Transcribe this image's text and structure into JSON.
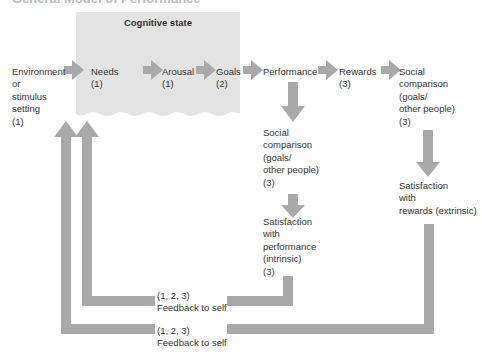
{
  "title": "General Model of Performance",
  "cognitive_state": {
    "label": "Cognitive state"
  },
  "nodes": {
    "environment": {
      "lines": [
        "Environment",
        "or",
        "stimulus",
        "setting",
        "(1)"
      ]
    },
    "needs": {
      "lines": [
        "Needs",
        "(1)"
      ]
    },
    "arousal": {
      "lines": [
        "Arousal",
        "(1)"
      ]
    },
    "goals": {
      "lines": [
        "Goals",
        "(2)"
      ]
    },
    "performance": {
      "lines": [
        "Performance"
      ]
    },
    "rewards": {
      "lines": [
        "Rewards",
        "(3)"
      ]
    },
    "social_comparison_rewards": {
      "lines": [
        "Social",
        "comparison",
        "(goals/",
        "other people)",
        "(3)"
      ]
    },
    "social_comparison_performance": {
      "lines": [
        "Social",
        "comparison",
        "(goals/",
        "other people)",
        "(3)"
      ]
    },
    "satisfaction_performance": {
      "lines": [
        "Satisfaction",
        "with",
        "performance",
        "(intrinsic)",
        "(3)"
      ]
    },
    "satisfaction_rewards": {
      "lines": [
        "Satisfaction",
        "with",
        "rewards (extrinsic)"
      ]
    },
    "feedback_inner": {
      "lines": [
        "(1, 2, 3)",
        "Feedback to self"
      ]
    },
    "feedback_outer": {
      "lines": [
        "(1, 2, 3)",
        "Feedback to self"
      ]
    }
  },
  "colors": {
    "arrow": "#a9a9a9",
    "box": "#e3e3e3",
    "text": "#333333"
  }
}
